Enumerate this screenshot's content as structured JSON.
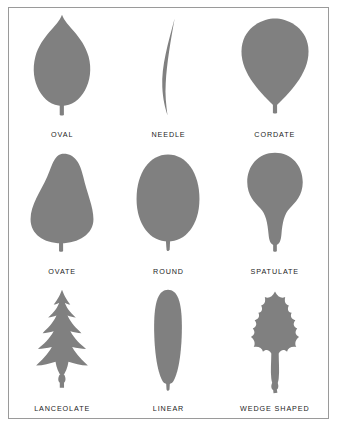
{
  "figure": {
    "border_color": "#9a9a9a",
    "background_color": "#ffffff",
    "leaf_fill_color": "#808080",
    "label_color": "#1d1d1d",
    "columns": 3,
    "rows": 3
  },
  "leaves": [
    {
      "label": "OVAL",
      "icon": "oval-leaf-icon",
      "row": 1,
      "column": 1
    },
    {
      "label": "NEEDLE",
      "icon": "needle-leaf-icon",
      "row": 1,
      "column": 2
    },
    {
      "label": "CORDATE",
      "icon": "cordate-leaf-icon",
      "row": 1,
      "column": 3
    },
    {
      "label": "OVATE",
      "icon": "ovate-leaf-icon",
      "row": 2,
      "column": 1
    },
    {
      "label": "ROUND",
      "icon": "round-leaf-icon",
      "row": 2,
      "column": 2
    },
    {
      "label": "SPATULATE",
      "icon": "spatulate-leaf-icon",
      "row": 2,
      "column": 3
    },
    {
      "label": "LANCEOLATE",
      "icon": "lanceolate-leaf-icon",
      "row": 3,
      "column": 1
    },
    {
      "label": "LINEAR",
      "icon": "linear-leaf-icon",
      "row": 3,
      "column": 2
    },
    {
      "label": "WEDGE SHAPED",
      "icon": "wedge-shaped-leaf-icon",
      "row": 3,
      "column": 3
    }
  ]
}
